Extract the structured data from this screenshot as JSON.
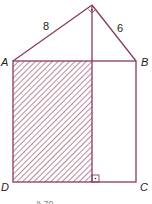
{
  "figure": {
    "stroke_color": "#8a3a5c",
    "hatch_color": "#8a3a5c",
    "points": {
      "A": "A",
      "B": "B",
      "C": "C",
      "D": "D"
    },
    "side_labels": {
      "left_leg": "8",
      "right_leg": "6"
    },
    "right_angle_marks": [
      "apex",
      "foot"
    ],
    "caption_cut": "ä 79"
  }
}
